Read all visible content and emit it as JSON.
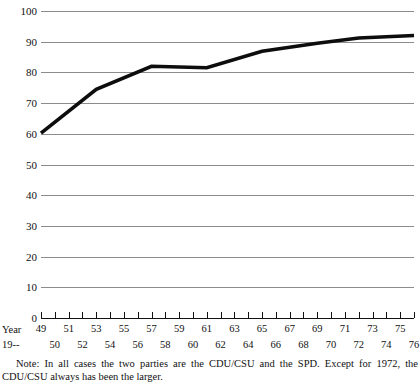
{
  "chart_data": {
    "type": "line",
    "title": "",
    "xlabel": "Year 19--",
    "ylabel": "",
    "ylim": [
      0,
      100
    ],
    "xlim": [
      49,
      76
    ],
    "grid": true,
    "legend": null,
    "yticks": [
      100,
      90,
      80,
      70,
      60,
      50,
      40,
      30,
      20,
      10,
      0
    ],
    "xticks_odd": [
      49,
      51,
      53,
      55,
      57,
      59,
      61,
      63,
      65,
      67,
      69,
      71,
      73,
      75
    ],
    "xticks_even": [
      50,
      52,
      54,
      56,
      58,
      60,
      62,
      64,
      66,
      68,
      70,
      72,
      74,
      76
    ],
    "xticks_all": [
      49,
      50,
      51,
      52,
      53,
      54,
      55,
      56,
      57,
      58,
      59,
      60,
      61,
      62,
      63,
      64,
      65,
      66,
      67,
      68,
      69,
      70,
      71,
      72,
      73,
      74,
      75,
      76
    ],
    "series": [
      {
        "name": "Two-party share",
        "x": [
          49,
          53,
          57,
          61,
          65,
          69,
          72,
          76
        ],
        "values": [
          60.2,
          74.5,
          82.0,
          81.5,
          86.9,
          89.5,
          91.2,
          92.0
        ]
      }
    ],
    "line_color": "#0d0d0d",
    "grid_color": "#8c8c8c",
    "axis_color": "#111111"
  },
  "axis": {
    "year_label_line1": "Year",
    "year_label_line2": "19--"
  },
  "note": {
    "text": "Note: In all cases the two parties are the CDU/CSU and the SPD. Except for 1972, the CDU/CSU always has been the larger."
  }
}
